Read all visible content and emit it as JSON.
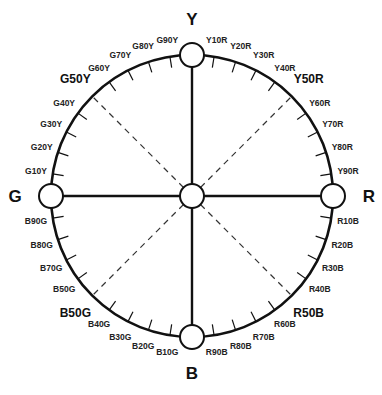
{
  "diagram": {
    "center": [
      192,
      196
    ],
    "radius": 141,
    "node_radius": 12,
    "stroke_color": "#111111",
    "dash_color": "#333333",
    "primaries": [
      {
        "label": "Y",
        "angle": -90
      },
      {
        "label": "R",
        "angle": 0
      },
      {
        "label": "B",
        "angle": 90
      },
      {
        "label": "G",
        "angle": 180
      }
    ],
    "quadrants": [
      {
        "from": "Y",
        "to": "R",
        "start_angle": -90,
        "ticks": [
          "Y10R",
          "Y20R",
          "Y30R",
          "Y40R",
          "Y50R",
          "Y60R",
          "Y70R",
          "Y80R",
          "Y90R"
        ]
      },
      {
        "from": "R",
        "to": "B",
        "start_angle": 0,
        "ticks": [
          "R10B",
          "R20B",
          "R30B",
          "R40B",
          "R50B",
          "R60B",
          "R70B",
          "R80B",
          "R90B"
        ]
      },
      {
        "from": "B",
        "to": "G",
        "start_angle": 90,
        "ticks": [
          "B10G",
          "B20G",
          "B30G",
          "B40G",
          "B50G",
          "B50G",
          "B70G",
          "B80G",
          "B90G"
        ]
      },
      {
        "from": "G",
        "to": "Y",
        "start_angle": 180,
        "ticks": [
          "G10Y",
          "G20Y",
          "G30Y",
          "G40Y",
          "G50Y",
          "G60Y",
          "G70Y",
          "G80Y",
          "G90Y"
        ]
      }
    ],
    "diagonal_labels": [
      "Y50R",
      "R50B",
      "B50G",
      "G50Y"
    ]
  }
}
